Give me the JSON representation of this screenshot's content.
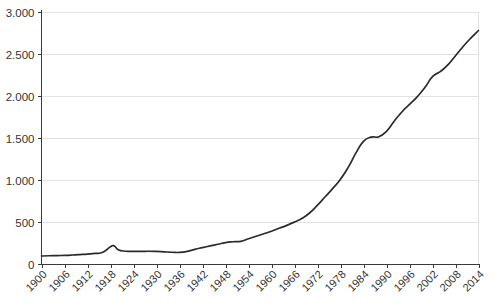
{
  "chart_data": {
    "type": "line",
    "title": "",
    "subtitle": "",
    "xlabel": "",
    "ylabel": "",
    "grid": "horizontal",
    "legend": "none",
    "xlim": [
      1900,
      2014
    ],
    "ylim": [
      0,
      3000
    ],
    "x_tick_labels": [
      "1900",
      "1906",
      "1912",
      "1918",
      "1924",
      "1930",
      "1936",
      "1942",
      "1948",
      "1954",
      "1960",
      "1966",
      "1972",
      "1978",
      "1984",
      "1990",
      "1996",
      "2002",
      "2008",
      "2014"
    ],
    "x_tick_values": [
      1900,
      1906,
      1912,
      1918,
      1924,
      1930,
      1936,
      1942,
      1948,
      1954,
      1960,
      1966,
      1972,
      1978,
      1984,
      1990,
      1996,
      2002,
      2008,
      2014
    ],
    "y_tick_labels": [
      "0",
      "500",
      "1.000",
      "1.500",
      "2.000",
      "2.500",
      "3.000"
    ],
    "y_tick_values": [
      0,
      500,
      1000,
      1500,
      2000,
      2500,
      3000
    ],
    "series": [
      {
        "name": "series-1",
        "color": "#2b2b2b",
        "x": [
          1900,
          1902,
          1904,
          1906,
          1908,
          1910,
          1912,
          1914,
          1916,
          1918,
          1919,
          1920,
          1922,
          1924,
          1926,
          1928,
          1930,
          1932,
          1934,
          1936,
          1938,
          1940,
          1942,
          1944,
          1946,
          1948,
          1950,
          1952,
          1954,
          1956,
          1958,
          1960,
          1962,
          1964,
          1966,
          1968,
          1970,
          1972,
          1974,
          1976,
          1978,
          1980,
          1982,
          1984,
          1986,
          1988,
          1990,
          1992,
          1994,
          1996,
          1998,
          2000,
          2002,
          2004,
          2006,
          2008,
          2010,
          2012,
          2014
        ],
        "y": [
          95,
          98,
          100,
          103,
          107,
          112,
          118,
          126,
          140,
          205,
          215,
          170,
          152,
          150,
          150,
          152,
          150,
          145,
          140,
          138,
          150,
          175,
          195,
          215,
          235,
          255,
          265,
          270,
          300,
          330,
          360,
          390,
          425,
          460,
          500,
          545,
          610,
          700,
          800,
          900,
          1010,
          1150,
          1320,
          1460,
          1510,
          1515,
          1580,
          1700,
          1810,
          1900,
          1990,
          2100,
          2230,
          2290,
          2370,
          2480,
          2590,
          2690,
          2780
        ]
      }
    ],
    "annotations": [
      {
        "label": "peak-1918",
        "x": 1918,
        "y": 205
      },
      {
        "label": "plateau-1985",
        "x": 1985,
        "y": 1512
      },
      {
        "label": "endpoint-2014",
        "x": 2014,
        "y": 2780
      }
    ]
  },
  "axes": {
    "y_axis_name": "y-axis",
    "x_axis_name": "x-axis"
  }
}
